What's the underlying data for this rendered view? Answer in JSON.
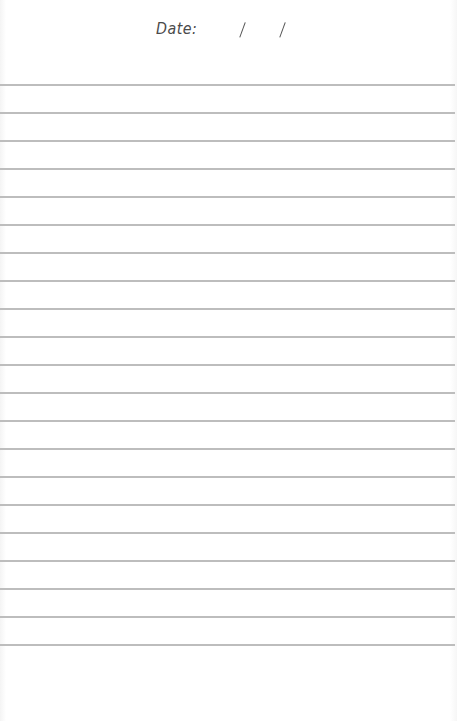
{
  "page": {
    "type": "lined-notebook-page",
    "header": {
      "date_label": "Date:",
      "date_separators": [
        "/",
        "/"
      ],
      "date_value": ""
    },
    "rules": {
      "count": 21,
      "first_y": 84,
      "spacing": 28,
      "color": "#bdbdbd"
    },
    "body_text": ""
  }
}
